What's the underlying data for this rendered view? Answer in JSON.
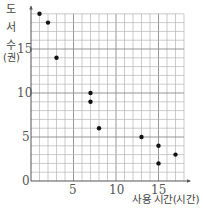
{
  "chart_data": {
    "type": "scatter",
    "title": "",
    "xlabel": "사용 시간(시간)",
    "ylabel": "도서 수(권)",
    "ylabel_chars": [
      "도",
      "서",
      "수",
      "(권)"
    ],
    "xlim": [
      0,
      18
    ],
    "ylim": [
      0,
      19.5
    ],
    "grid": true,
    "legend": null,
    "x_ticks": [
      0,
      5,
      10,
      15
    ],
    "y_ticks": [
      0,
      5,
      10,
      15
    ],
    "x_tick_labels": [
      "5",
      "10",
      "15"
    ],
    "y_tick_labels": [
      "0",
      "5",
      "10",
      "15"
    ],
    "points": [
      {
        "x": 1,
        "y": 19
      },
      {
        "x": 2,
        "y": 18
      },
      {
        "x": 3,
        "y": 14
      },
      {
        "x": 7,
        "y": 10
      },
      {
        "x": 7,
        "y": 9
      },
      {
        "x": 8,
        "y": 6
      },
      {
        "x": 13,
        "y": 5
      },
      {
        "x": 15,
        "y": 4
      },
      {
        "x": 15,
        "y": 2
      },
      {
        "x": 17,
        "y": 3
      }
    ]
  },
  "axis": {
    "y_label_1": "도",
    "y_label_2": "서",
    "y_label_3": "수",
    "y_label_4": "(권)",
    "x_label": "사용 시간(시간)",
    "origin": "0",
    "x5": "5",
    "x10": "10",
    "x15": "15",
    "y5": "5",
    "y10": "10",
    "y15": "15"
  }
}
